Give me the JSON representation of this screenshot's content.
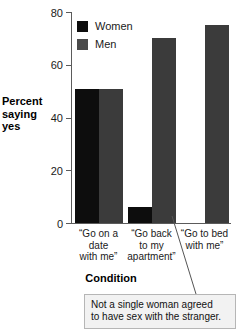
{
  "chart_data": {
    "type": "bar",
    "title": "",
    "xlabel": "Condition",
    "ylabel": "Percent saying yes",
    "ylim": [
      0,
      80
    ],
    "yticks": [
      0,
      20,
      40,
      60,
      80
    ],
    "grid": false,
    "legend_position": "top-left inside plot",
    "categories": [
      "“Go on a date with me”",
      "“Go back to my apartment”",
      "“Go to bed with me”"
    ],
    "category_lines": [
      [
        "“Go on a",
        "date",
        "with me”"
      ],
      [
        "“Go back",
        "to my",
        "apartment”"
      ],
      [
        "“Go to bed",
        "with me”"
      ]
    ],
    "series": [
      {
        "name": "Women",
        "color": "#0d0d0d",
        "values": [
          51,
          6,
          0
        ]
      },
      {
        "name": "Men",
        "color": "#3b3b3b",
        "values": [
          51,
          70,
          75
        ]
      }
    ],
    "annotations": [
      {
        "name": "zero-women-callout",
        "text": "Not a single woman agreed to have sex with the stranger.",
        "lines": [
          "Not a single woman agreed",
          "to have sex with the stranger."
        ],
        "points_to": "Women bar in “Go to bed with me” condition"
      }
    ]
  },
  "axis": {
    "y_title_lines": [
      "Percent",
      "saying",
      "yes"
    ],
    "y_tick_labels": [
      "80",
      "60",
      "40",
      "20",
      "0"
    ],
    "x_title": "Condition"
  },
  "legend": {
    "entries": [
      {
        "label": "Women",
        "swatch": "black-square-icon"
      },
      {
        "label": "Men",
        "swatch": "gray-square-icon"
      }
    ]
  },
  "callout": {
    "line1": "Not a single woman agreed",
    "line2": "to have sex with the stranger."
  },
  "colors": {
    "women": "#0d0d0d",
    "men": "#3b3b3b",
    "axis": "#5b5b5b",
    "callout_bg": "#f2f2f2",
    "callout_border": "#b6b6b6",
    "background": "#ffffff"
  }
}
